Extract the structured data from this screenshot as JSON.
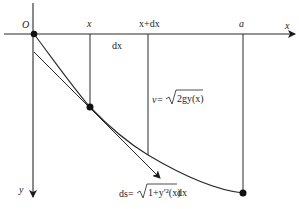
{
  "diagram": {
    "origin_label": "O",
    "x_axis_label": "x",
    "y_axis_label": "y",
    "tick_x_label": "x",
    "tick_xdx_label": "x+dx",
    "tick_a_label": "a",
    "dx_label": "dx",
    "velocity_label_lhs": "v=",
    "velocity_label_rad": "2gy(x)",
    "arc_label_lhs": "ds=",
    "arc_label_rad": "1+y′²(x)",
    "arc_label_rhs": " dx",
    "colors": {
      "line": "#2a2a2a",
      "background": "#ffffff"
    }
  }
}
